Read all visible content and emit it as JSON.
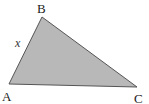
{
  "diagram": {
    "type": "triangle",
    "fill_color": "#b8b8b8",
    "stroke_color": "#555555",
    "vertices": [
      {
        "name": "A",
        "x": 9,
        "y": 84,
        "label_x": 2,
        "label_y": 101
      },
      {
        "name": "B",
        "x": 42,
        "y": 17,
        "label_x": 37,
        "label_y": 13
      },
      {
        "name": "C",
        "x": 137,
        "y": 87,
        "label_x": 134,
        "label_y": 103
      }
    ],
    "side_labels": [
      {
        "side": "AB",
        "text": "x",
        "x": 15,
        "y": 47
      }
    ]
  }
}
